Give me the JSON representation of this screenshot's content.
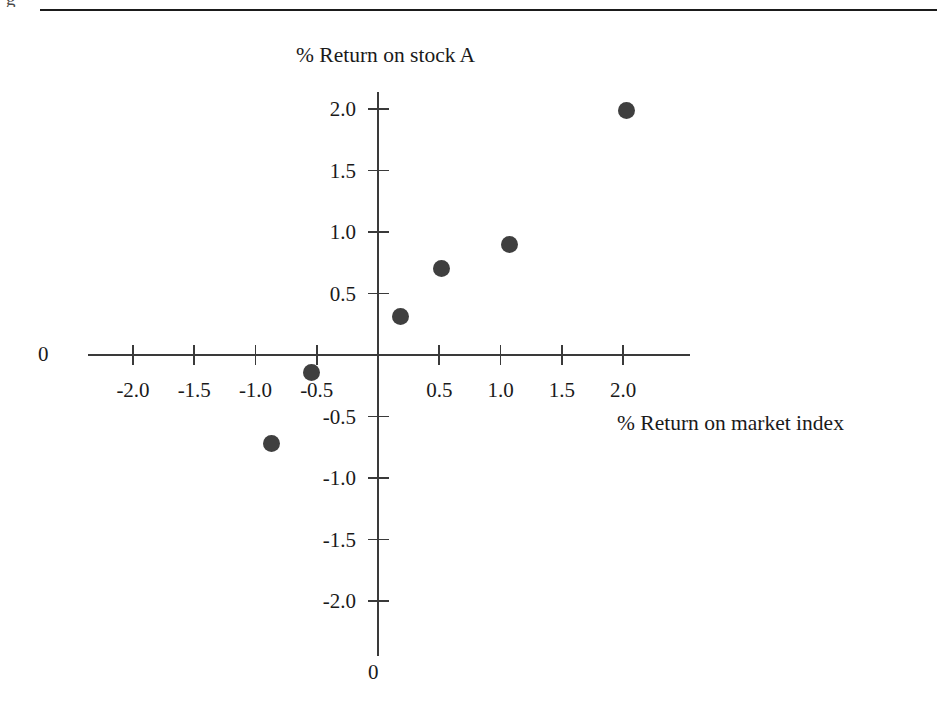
{
  "figure": {
    "top_rule": true,
    "clipped_glyph": "g"
  },
  "chart_data": {
    "type": "scatter",
    "title": "",
    "xlabel": "% Return on market index",
    "ylabel": "% Return on stock A",
    "xlim": [
      -2.4,
      2.55
    ],
    "ylim": [
      -2.4,
      2.15
    ],
    "grid": false,
    "legend": null,
    "x_origin_label": "0",
    "y_origin_label": "0",
    "xticks": [
      -2.0,
      -1.5,
      -1.0,
      -0.5,
      0.5,
      1.0,
      1.5,
      2.0
    ],
    "xticklabels": [
      "-2.0",
      "-1.5",
      "-1.0",
      "-0.5",
      "0.5",
      "1.0",
      "1.5",
      "2.0"
    ],
    "yticks": [
      2.0,
      1.5,
      1.0,
      0.5,
      -0.5,
      -1.0,
      -1.5,
      -2.0
    ],
    "yticklabels": [
      "2.0",
      "1.5",
      "1.0",
      "0.5",
      "-0.5",
      "-1.0",
      "-1.5",
      "-2.0"
    ],
    "marker_color": "#3f3f3f",
    "axis_color": "#3a3a3a",
    "points": [
      {
        "x": -0.87,
        "y": -0.72
      },
      {
        "x": -0.54,
        "y": -0.14
      },
      {
        "x": 0.18,
        "y": 0.31
      },
      {
        "x": 0.52,
        "y": 0.7
      },
      {
        "x": 1.07,
        "y": 0.9
      },
      {
        "x": 2.03,
        "y": 1.99
      }
    ]
  }
}
